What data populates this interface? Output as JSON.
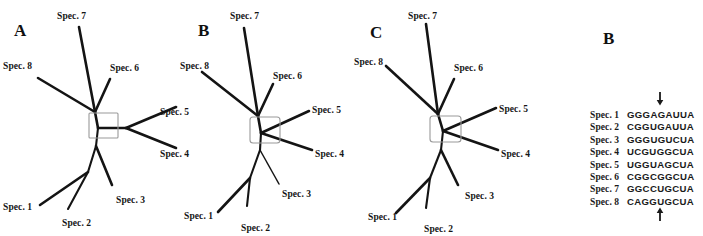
{
  "figure": {
    "panels": [
      {
        "id": "a",
        "letter": "A",
        "leaves": [
          {
            "name": "Spec. 1",
            "x": 3,
            "y": 203
          },
          {
            "name": "Spec. 2",
            "x": 62,
            "y": 219
          },
          {
            "name": "Spec. 3",
            "x": 136,
            "y": 196
          },
          {
            "name": "Spec. 4",
            "x": 194,
            "y": 150
          },
          {
            "name": "Spec. 5",
            "x": 194,
            "y": 113
          },
          {
            "name": "Spec. 6",
            "x": 134,
            "y": 68
          },
          {
            "name": "Spec. 7",
            "x": 69,
            "y": 13
          },
          {
            "name": "Spec. 8",
            "x": 5,
            "y": 65
          }
        ]
      },
      {
        "id": "b",
        "letter": "B",
        "leaves": [
          {
            "name": "Spec. 1",
            "x": 6,
            "y": 212
          },
          {
            "name": "Spec. 2",
            "x": 63,
            "y": 224
          },
          {
            "name": "Spec. 3",
            "x": 126,
            "y": 193
          },
          {
            "name": "Spec. 4",
            "x": 191,
            "y": 153
          },
          {
            "name": "Spec. 5",
            "x": 186,
            "y": 112
          },
          {
            "name": "Spec. 6",
            "x": 140,
            "y": 78
          },
          {
            "name": "Spec. 7",
            "x": 76,
            "y": 13
          },
          {
            "name": "Spec. 8",
            "x": 11,
            "y": 66
          }
        ]
      },
      {
        "id": "c",
        "letter": "C",
        "leaves": [
          {
            "name": "Spec. 1",
            "x": 20,
            "y": 213
          },
          {
            "name": "Spec. 2",
            "x": 76,
            "y": 225
          },
          {
            "name": "Spec. 3",
            "x": 143,
            "y": 196
          },
          {
            "name": "Spec. 4",
            "x": 198,
            "y": 152
          },
          {
            "name": "Spec. 5",
            "x": 196,
            "y": 110
          },
          {
            "name": "Spec. 6",
            "x": 148,
            "y": 68
          },
          {
            "name": "Spec. 7",
            "x": 80,
            "y": 14
          },
          {
            "name": "Spec. 8",
            "x": 12,
            "y": 60
          }
        ]
      }
    ]
  },
  "alignment": {
    "letter": "B",
    "marker_top_icon": "down-arrow-icon",
    "marker_bottom_icon": "up-arrow-icon",
    "rows": [
      {
        "name": "Spec. 1",
        "sequence": "GGGAGAUUA"
      },
      {
        "name": "Spec. 2",
        "sequence": "CGGUGAUUA"
      },
      {
        "name": "Spec. 3",
        "sequence": "GGGUGUCUA"
      },
      {
        "name": "Spec. 4",
        "sequence": "UCGUGGCUA"
      },
      {
        "name": "Spec. 5",
        "sequence": "UGGUAGCUA"
      },
      {
        "name": "Spec. 6",
        "sequence": "CGGCGGCUA"
      },
      {
        "name": "Spec. 7",
        "sequence": "GGCCUGCUA"
      },
      {
        "name": "Spec. 8",
        "sequence": "CAGGUGCUA"
      }
    ]
  },
  "colors": {
    "background": "#ffffff",
    "branch": "#141414",
    "text": "#1a1a1a",
    "highlight_box": "#9a9a9a"
  }
}
